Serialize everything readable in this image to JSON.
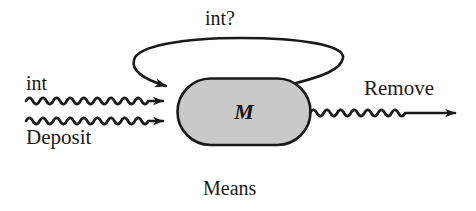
{
  "figure": {
    "caption": "Means",
    "background_color": "#ffffff",
    "stroke_color": "#1a1a1a",
    "box": {
      "label": "M",
      "shape": "stadium",
      "fill_color": "#c9c9c9",
      "border_color": "#1a1a1a"
    },
    "inputs": [
      {
        "label": "int",
        "style": "wavy-arrow",
        "direction": "right"
      },
      {
        "label": "Deposit",
        "style": "wavy-arrow",
        "direction": "right"
      }
    ],
    "outputs": [
      {
        "label": "Remove",
        "style": "wavy-arrow",
        "direction": "right"
      }
    ],
    "feedback": {
      "label": "int?",
      "style": "curved-arrow",
      "from": "box-right",
      "to": "box-left"
    }
  }
}
